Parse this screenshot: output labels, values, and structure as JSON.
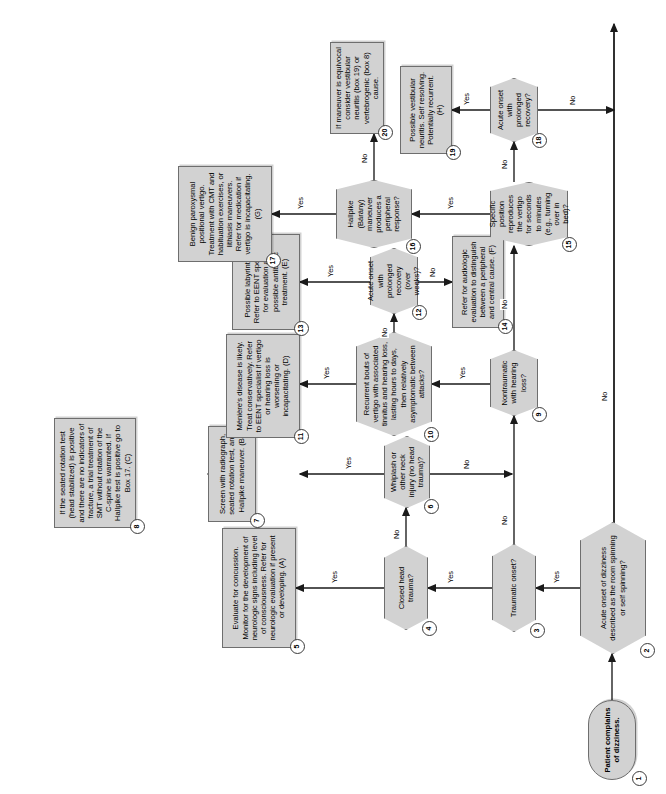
{
  "document": {
    "type": "clinical-decision-flowchart",
    "title": "Dizziness clinical decision flowchart",
    "orientation": "rotated-90-ccw",
    "colors": {
      "node_fill": "#d2d2d2",
      "node_border": "#6e6e6e",
      "page_background": "#ffffff",
      "text": "#000000",
      "badge_fill": "#ffffff"
    }
  },
  "labels": {
    "yes": "Yes",
    "no": "No"
  },
  "nodes": [
    {
      "id": "1",
      "shape": "terminator",
      "text": "Patient complains of dizziness."
    },
    {
      "id": "2",
      "shape": "decision",
      "text": "Acute onset of dizziness described as the room spinning or self spinning?"
    },
    {
      "id": "3",
      "shape": "decision",
      "text": "Traumatic onset?"
    },
    {
      "id": "4",
      "shape": "decision",
      "text": "Closed head trauma?"
    },
    {
      "id": "5",
      "shape": "process",
      "text": "Evaluate for concussion. Monitor for the development of neurologic signs including level of consciousness. Refer for neurologic evaluation if present or developing. (A)"
    },
    {
      "id": "6",
      "shape": "decision",
      "text": "Whiplash or other neck injury (no head trauma)?"
    },
    {
      "id": "7",
      "shape": "process",
      "text": "Screen with radiograph, seated rotation test, and Hallpike maneuver. (B)"
    },
    {
      "id": "8",
      "shape": "process",
      "text": "If the seated rotation test (head stabilized) is positive and there are no indicators of fracture, a trial treatment of SMT without rotation of the C-spine is warranted. If Hallpike test is positive go to Box 17. (C)"
    },
    {
      "id": "9",
      "shape": "decision",
      "text": "Nontraumatic with hearing loss?"
    },
    {
      "id": "10",
      "shape": "decision",
      "text": "Recurrent bouts of vertigo with associated tinnitus and hearing loss, lasting hours to days, then relatively asymptomatic between attacks?"
    },
    {
      "id": "11",
      "shape": "process",
      "text": "Ménière's disease is likely. Treat conservatively. Refer to EENT specialist if vertigo or hearing loss is worsening or incapacitating. (D)"
    },
    {
      "id": "12",
      "shape": "decision",
      "text": "Acute onset with prolonged recovery (over weeks)?"
    },
    {
      "id": "13",
      "shape": "process",
      "text": "Possible labyrinthitis. Refer to EENT specialist for evaluation and possible antibiotic treatment. (E)"
    },
    {
      "id": "14",
      "shape": "process",
      "text": "Refer for audiologic evaluation to distinguish between a peripheral and central cause. (F)"
    },
    {
      "id": "15",
      "shape": "decision",
      "text": "Specific position reproduces the vertigo for seconds to minutes (e.g., turning over in bed)?"
    },
    {
      "id": "16",
      "shape": "decision",
      "text": "Hallpike (Bárány) maneuver produces a peripheral response?"
    },
    {
      "id": "17",
      "shape": "process",
      "text": "Benign paroxysmal positional vertigo. Treatment with CMT and habituation exercises, or lithiasis maneuvers. Refer for medication if vertigo is incapacitating. (G)"
    },
    {
      "id": "18",
      "shape": "decision",
      "text": "Acute onset with prolonged recovery?"
    },
    {
      "id": "19",
      "shape": "process",
      "text": "Possible vestibular neuritis. Self resolving. Potentially recurrent. (H)"
    },
    {
      "id": "20",
      "shape": "process",
      "text": "If maneuver is equivocal consider vestibular neuritis (box 19) or vertebrogenic (box 8) cause."
    }
  ],
  "edges": [
    {
      "from": "1",
      "to": "2",
      "label": ""
    },
    {
      "from": "2",
      "to": "3",
      "label": "Yes"
    },
    {
      "from": "2",
      "to": "bottom-rail",
      "label": "No"
    },
    {
      "from": "3",
      "to": "4",
      "label": "Yes"
    },
    {
      "from": "3",
      "to": "9",
      "label": "No"
    },
    {
      "from": "4",
      "to": "5",
      "label": "Yes"
    },
    {
      "from": "4",
      "to": "6",
      "label": "No"
    },
    {
      "from": "6",
      "to": "7",
      "label": "Yes"
    },
    {
      "from": "6",
      "to": "9",
      "label": "No"
    },
    {
      "from": "7",
      "to": "8",
      "label": ""
    },
    {
      "from": "9",
      "to": "10",
      "label": "Yes"
    },
    {
      "from": "9",
      "to": "15",
      "label": "No"
    },
    {
      "from": "10",
      "to": "11",
      "label": "Yes"
    },
    {
      "from": "10",
      "to": "12",
      "label": "No"
    },
    {
      "from": "12",
      "to": "13",
      "label": "Yes"
    },
    {
      "from": "12",
      "to": "14",
      "label": "No"
    },
    {
      "from": "15",
      "to": "16",
      "label": "Yes"
    },
    {
      "from": "15",
      "to": "18",
      "label": "No"
    },
    {
      "from": "16",
      "to": "17",
      "label": "Yes"
    },
    {
      "from": "16",
      "to": "20",
      "label": "No"
    },
    {
      "from": "18",
      "to": "19",
      "label": "Yes"
    },
    {
      "from": "18",
      "to": "bottom-rail",
      "label": "No"
    }
  ]
}
